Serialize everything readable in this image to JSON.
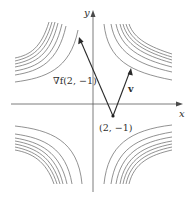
{
  "diagram": {
    "type": "contour-plot-with-vectors",
    "axes": {
      "x_label": "x",
      "y_label": "y",
      "origin_px": [
        93,
        104
      ]
    },
    "point": {
      "label": "(2, −1)",
      "coords": [
        2,
        -1
      ]
    },
    "vectors": [
      {
        "name": "gradient",
        "label": "∇f(2, −1)"
      },
      {
        "name": "direction",
        "label": "v"
      }
    ],
    "contour_quadrants": [
      "upper-left",
      "upper-right",
      "lower-left",
      "lower-right"
    ],
    "contours_per_quadrant": 7,
    "colors": {
      "contour": "#6e6e6e",
      "axis": "#5a5a5a",
      "vector": "#2a2a2a",
      "text": "#2e2e2e"
    }
  }
}
